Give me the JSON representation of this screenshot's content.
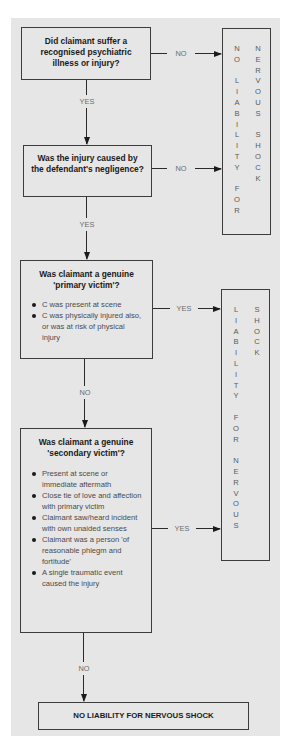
{
  "diagram": {
    "colors": {
      "panel_bg": "#e6e6e6",
      "border": "#3c3c3c",
      "label_gray": "#6b6b6b"
    },
    "nodes": {
      "q1": {
        "question": "Did claimant suffer a recognised psychiatric illness or injury?"
      },
      "q2": {
        "question": "Was the injury caused by the defendant's negligence?"
      },
      "q3": {
        "question": "Was claimant a genuine 'primary victim'?",
        "bullets": [
          "C was present at scene",
          "C was physically injured also, or was at risk of physical injury"
        ]
      },
      "q4": {
        "question": "Was claimant a genuine 'secondary victim'?",
        "bullets": [
          "Present at scene or immediate aftermath",
          "Close tie of love and affection with primary victim",
          "Claimant saw/heard incident with own unaided senses",
          "Claimant was a person 'of reasonable phlegm and fortitude'",
          "A single traumatic event caused the injury"
        ]
      },
      "outcome_no_liability_side": {
        "col1": [
          "N",
          "O",
          " ",
          "L",
          "I",
          "A",
          "B",
          "I",
          "L",
          "I",
          "T",
          "Y",
          " ",
          "F",
          "O",
          "R"
        ],
        "col2": [
          "N",
          "E",
          "R",
          "V",
          "O",
          "U",
          "S",
          " ",
          "S",
          "H",
          "O",
          "C",
          "K"
        ],
        "text": "NO LIABILITY FOR NERVOUS SHOCK"
      },
      "outcome_liability_side": {
        "col1": [
          "L",
          "I",
          "A",
          "B",
          "I",
          "L",
          "I",
          "T",
          "Y",
          " ",
          "F",
          "O",
          "R",
          " ",
          "N",
          "E",
          "R",
          "V",
          "O",
          "U",
          "S"
        ],
        "col2": [
          "S",
          "H",
          "O",
          "C",
          "K"
        ],
        "text": "LIABILITY FOR NERVOUS SHOCK"
      },
      "final": {
        "text": "NO LIABILITY FOR NERVOUS SHOCK"
      }
    },
    "edges": {
      "q1_no": "NO",
      "q1_yes": "YES",
      "q2_no": "NO",
      "q2_yes": "YES",
      "q3_yes": "YES",
      "q3_no": "NO",
      "q4_yes": "YES",
      "q4_no": "NO"
    }
  }
}
